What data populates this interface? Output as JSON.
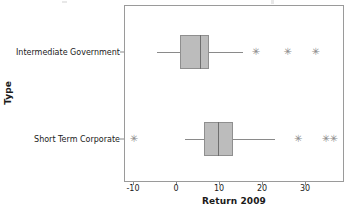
{
  "chart_data": {
    "type": "box",
    "title": "",
    "xlabel": "Return 2009",
    "ylabel": "Type",
    "orientation": "horizontal",
    "xlim": [
      -13.5,
      39
    ],
    "xticks": [
      -10,
      0,
      10,
      20,
      30
    ],
    "xtick_labels": [
      "-10",
      "0",
      "10",
      "20",
      "30"
    ],
    "grid": false,
    "legend": null,
    "categories": [
      "Intermediate Government",
      "Short Term Corporate"
    ],
    "boxes": [
      {
        "category": "Intermediate Government",
        "whisker_low": -4.4,
        "q1": 1.0,
        "median": 5.6,
        "q3": 7.7,
        "whisker_high": 15.6,
        "outliers": [
          18.6,
          26.0,
          32.5
        ]
      },
      {
        "category": "Short Term Corporate",
        "whisker_low": 2.1,
        "q1": 6.5,
        "median": 9.8,
        "q3": 13.3,
        "whisker_high": 23.0,
        "outliers": [
          -9.8,
          28.4,
          34.9,
          36.7
        ]
      }
    ],
    "colors": {
      "box_fill": "#bcbcbc",
      "box_edge": "#8f8f8f",
      "median": "#6f6f6f",
      "whisker": "#8a8a8a",
      "outlier": "#8a8a8a",
      "frame": "#9a9a9a",
      "background": "#ffffff"
    },
    "outlier_marker": "asterisk-marker"
  },
  "axes": {
    "x_title": "Return 2009",
    "y_title": "Type"
  },
  "xticks": [
    {
      "label": "-10",
      "value": -10
    },
    {
      "label": "0",
      "value": 0
    },
    {
      "label": "10",
      "value": 10
    },
    {
      "label": "20",
      "value": 20
    },
    {
      "label": "30",
      "value": 30
    }
  ],
  "yticks": [
    {
      "label": "Intermediate Government"
    },
    {
      "label": "Short Term Corporate"
    }
  ],
  "markers": {
    "outlier_glyph": "✳"
  }
}
